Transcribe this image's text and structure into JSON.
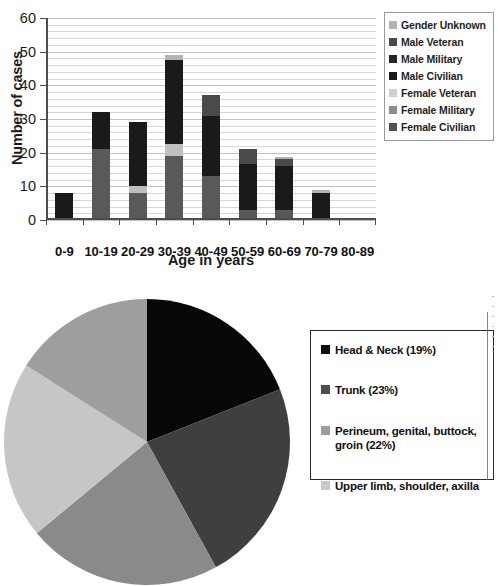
{
  "chart_data": [
    {
      "type": "bar",
      "id": "age-distribution",
      "title": "",
      "xlabel": "Age in years",
      "ylabel": "Number of cases",
      "ylim": [
        0,
        60
      ],
      "ytick_labels": [
        "0",
        "10",
        "20",
        "30",
        "40",
        "50",
        "60"
      ],
      "ytick_values": [
        0,
        10,
        20,
        30,
        40,
        50,
        60
      ],
      "minor_gridline_step": 2,
      "grid": true,
      "stacked": true,
      "legend_position": "right",
      "categories": [
        "0-9",
        "10-19",
        "20-29",
        "30-39",
        "40-49",
        "50-59",
        "60-69",
        "70-79",
        "80-89"
      ],
      "series": [
        {
          "name": "Female Civilian",
          "color": "#595959",
          "values": [
            0,
            21,
            8,
            19,
            13,
            3,
            3,
            0,
            0
          ]
        },
        {
          "name": "Female Military",
          "color": "#808080",
          "values": [
            0,
            0,
            0,
            0,
            0,
            0,
            0,
            0,
            0
          ]
        },
        {
          "name": "Female Veteran",
          "color": "#bfbfbf",
          "values": [
            0,
            0,
            2,
            3.5,
            0,
            0,
            0,
            0,
            0
          ]
        },
        {
          "name": "Male Civilian",
          "color": "#1a1a1a",
          "values": [
            8,
            11,
            19,
            25,
            18,
            13.5,
            13,
            8,
            0
          ]
        },
        {
          "name": "Male Military",
          "color": "#262626",
          "values": [
            0,
            0,
            0,
            0,
            0,
            0,
            0,
            0,
            0
          ]
        },
        {
          "name": "Male Veteran",
          "color": "#4a4a4a",
          "values": [
            0,
            0,
            0,
            0,
            6,
            4.5,
            2,
            0,
            0
          ]
        },
        {
          "name": "Gender Unknown",
          "color": "#b3b3b3",
          "values": [
            0,
            0,
            0,
            1.5,
            0,
            0,
            0.8,
            0.8,
            0
          ]
        }
      ],
      "totals": [
        8,
        32,
        29,
        49,
        37,
        21,
        18,
        8.8,
        0
      ],
      "legend": [
        {
          "label": "Gender Unknown",
          "color": "#b3b3b3"
        },
        {
          "label": "Male Veteran",
          "color": "#4a4a4a"
        },
        {
          "label": "Male Military",
          "color": "#262626"
        },
        {
          "label": "Male Civilian",
          "color": "#1a1a1a"
        },
        {
          "label": "Female Veteran",
          "color": "#cfcfcf"
        },
        {
          "label": "Female Military",
          "color": "#8c8c8c"
        },
        {
          "label": "Female Civilian",
          "color": "#4f4f4f"
        }
      ]
    },
    {
      "type": "pie",
      "id": "anatomic-site-distribution",
      "title": "",
      "start_angle_deg": 0,
      "direction": "clockwise",
      "labels": [
        "Head & Neck (19%)",
        "Trunk (23%)",
        "Perineum, genital, buttock, groin (22%)",
        "Upper limb, shoulder, axilla"
      ],
      "slices": [
        {
          "label": "Head & Neck (19%)",
          "value": 19,
          "color": "#070707"
        },
        {
          "label": "Trunk (23%)",
          "value": 23,
          "color": "#3f3f3f"
        },
        {
          "label": "Perineum, genital, buttock, groin (22%)",
          "value": 22,
          "color": "#8a8a8a"
        },
        {
          "label": "Upper limb, shoulder, axilla",
          "value": 20,
          "color": "#c6c6c6"
        },
        {
          "label": "",
          "value": 16,
          "color": "#9e9e9e"
        }
      ],
      "legend_position": "right",
      "legend": [
        {
          "label": "Head & Neck (19%)",
          "color": "#0d0d0d"
        },
        {
          "label": "Trunk (23%)",
          "color": "#4d4d4d"
        },
        {
          "label": "Perineum, genital, buttock,",
          "label2": "groin (22%)",
          "color": "#9d9d9d"
        },
        {
          "label": "Upper limb, shoulder, axilla",
          "color": "#c8c8c8"
        }
      ]
    }
  ],
  "bar_chart": {
    "y_axis_title": "Number of cases",
    "x_axis_title": "Age in years"
  }
}
